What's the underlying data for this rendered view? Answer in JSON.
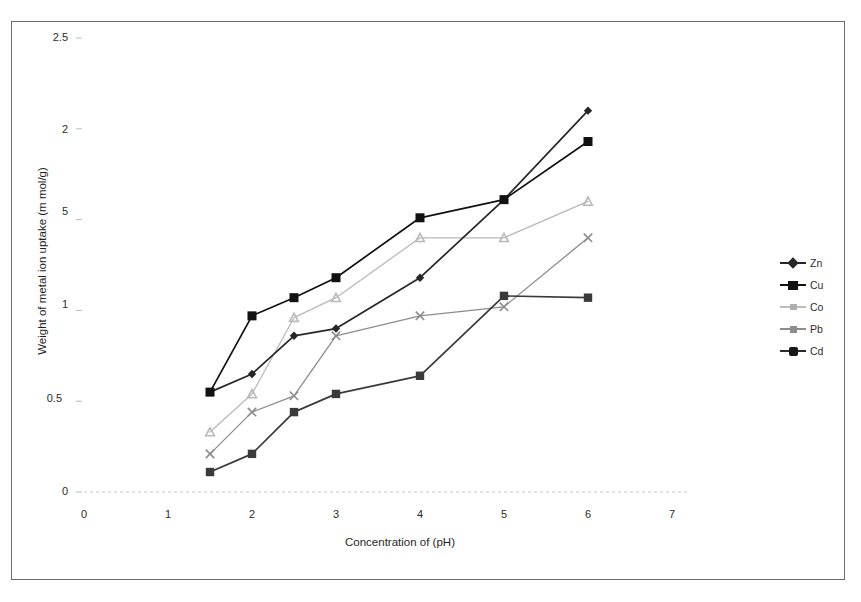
{
  "chart_data": {
    "type": "line",
    "title": "",
    "xlabel": "Concentration of (pH)",
    "ylabel": "Weight of metal ion uptake (m mol/g)",
    "xlim": [
      0,
      7
    ],
    "ylim": [
      0,
      2.5
    ],
    "xticks": [
      "0",
      "1",
      "2",
      "3",
      "4",
      "5",
      "6",
      "7"
    ],
    "xtick_values": [
      0,
      1,
      2,
      3,
      4,
      5,
      6,
      7
    ],
    "yticks": [
      "0",
      "0.5",
      "1",
      "5",
      "2",
      "2.5"
    ],
    "ytick_values": [
      0,
      0.5,
      1,
      1.5,
      2,
      2.5
    ],
    "grid": false,
    "legend_position": "right",
    "x": [
      1.5,
      2,
      2.5,
      3,
      4,
      5,
      6
    ],
    "series": [
      {
        "name": "Zn",
        "marker": "diamond",
        "color": "#262626",
        "values": [
          0.55,
          0.65,
          0.86,
          0.9,
          1.18,
          1.61,
          2.1
        ]
      },
      {
        "name": "Cu",
        "marker": "square-filled",
        "color": "#111111",
        "values": [
          0.55,
          0.97,
          1.07,
          1.18,
          1.51,
          1.61,
          1.93
        ]
      },
      {
        "name": "Co",
        "marker": "triangle-light",
        "color": "#b9b9b9",
        "values": [
          0.33,
          0.54,
          0.96,
          1.07,
          1.4,
          1.4,
          1.6
        ]
      },
      {
        "name": "Pb",
        "marker": "cross-gray",
        "color": "#8c8c8c",
        "values": [
          0.21,
          0.44,
          0.53,
          0.86,
          0.97,
          1.02,
          1.4
        ]
      },
      {
        "name": "Cd",
        "marker": "square-dark",
        "color": "#3a3a3a",
        "values": [
          0.11,
          0.21,
          0.44,
          0.54,
          0.64,
          1.08,
          1.07
        ]
      }
    ]
  },
  "legend": {
    "items": [
      {
        "label": "Zn"
      },
      {
        "label": "Cu"
      },
      {
        "label": "Co"
      },
      {
        "label": "Pb"
      },
      {
        "label": "Cd"
      }
    ]
  },
  "axes": {
    "y_title": "Weight of metal ion uptake (m mol/g)",
    "x_title": "Concentration of (pH)"
  }
}
